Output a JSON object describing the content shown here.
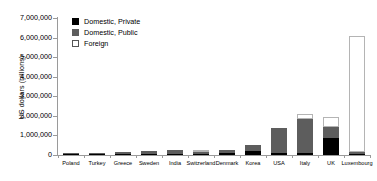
{
  "chart_data": {
    "type": "bar",
    "stacked": true,
    "title": "",
    "xlabel": "",
    "ylabel": "US dollars (billions)",
    "ylim": [
      0,
      7000000
    ],
    "ytick_values": [
      0,
      1000000,
      2000000,
      3000000,
      4000000,
      5000000,
      6000000,
      7000000
    ],
    "ytick_labels": [
      "0",
      "1,000,000",
      "2,000,000",
      "3,000,000",
      "4,000,000",
      "5,000,000",
      "6,000,000",
      "7,000,000"
    ],
    "grid": false,
    "legend_position": "upper-left-inside",
    "categories": [
      "Poland",
      "Turkey",
      "Greece",
      "Sweden",
      "India",
      "Switzerland",
      "Denmark",
      "Korea",
      "USA",
      "Italy",
      "UK",
      "Luxembourg"
    ],
    "series": [
      {
        "name": "Domestic, Private",
        "color": "#000000",
        "values": [
          10000,
          20000,
          30000,
          40000,
          60000,
          30000,
          120000,
          190000,
          110000,
          90000,
          880000,
          60000
        ]
      },
      {
        "name": "Domestic, Public",
        "color": "#5d5d5d",
        "values": [
          40000,
          80000,
          130000,
          150000,
          180000,
          120000,
          130000,
          330000,
          1280000,
          1760000,
          540000,
          70000
        ]
      },
      {
        "name": "Foreign",
        "color": "#ffffff",
        "values": [
          0,
          0,
          0,
          0,
          0,
          90000,
          0,
          0,
          0,
          250000,
          510000,
          5930000
        ]
      }
    ],
    "totals": [
      50000,
      100000,
      160000,
      190000,
      240000,
      240000,
      250000,
      520000,
      1390000,
      2100000,
      1930000,
      6060000
    ]
  },
  "legend": {
    "entries": [
      {
        "label": "Domestic, Private",
        "swatch": "black-square"
      },
      {
        "label": "Domestic, Public",
        "swatch": "gray-square"
      },
      {
        "label": "Foreign",
        "swatch": "white-square"
      }
    ]
  },
  "colors": {
    "private": "#000000",
    "public": "#5d5d5d",
    "foreign": "#ffffff",
    "axis": "#9a9a9a",
    "outline": "#b4b4b4",
    "background": "#ffffff"
  }
}
